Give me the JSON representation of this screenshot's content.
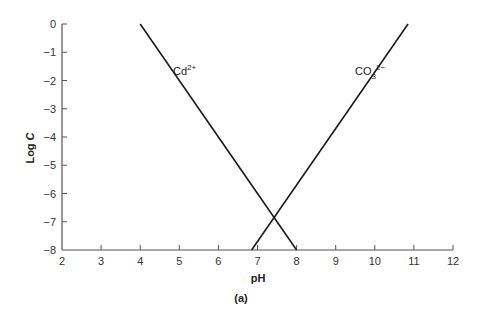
{
  "chart_data": {
    "type": "line",
    "title": "",
    "caption": "(a)",
    "xlabel": "pH",
    "ylabel": "Log C",
    "xlim": [
      2,
      12
    ],
    "ylim": [
      -8,
      0
    ],
    "xticks": [
      "2",
      "3",
      "4",
      "5",
      "6",
      "7",
      "8",
      "9",
      "10",
      "11",
      "12"
    ],
    "yticks": [
      "0",
      "-1",
      "-2",
      "-3",
      "-4",
      "-5",
      "-6",
      "-7",
      "-8"
    ],
    "grid": false,
    "legend": "none (inline labels)",
    "series": [
      {
        "name": "Cd2+",
        "label_base": "Cd",
        "label_sup": "2+",
        "x": [
          4.0,
          8.0
        ],
        "y": [
          0,
          -8
        ]
      },
      {
        "name": "CO3 2-",
        "label_base": "CO",
        "label_sub": "3",
        "label_sup": "2−",
        "x": [
          6.85,
          10.85
        ],
        "y": [
          -8,
          0
        ]
      }
    ],
    "annotations": [
      {
        "text": "intersection",
        "x": 7.4,
        "y": -6.9
      }
    ]
  }
}
